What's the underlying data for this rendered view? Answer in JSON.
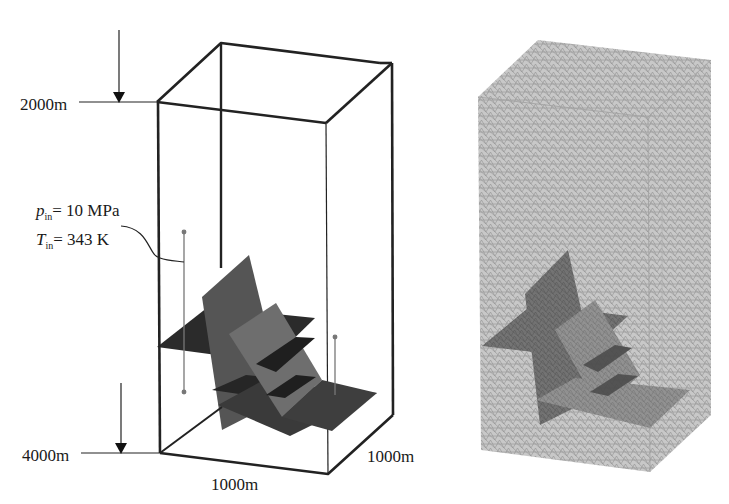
{
  "left_panel": {
    "name": "geometric-model",
    "depth_top_label": "2000m",
    "depth_bottom_label": "4000m",
    "width_label": "1000m",
    "length_label": "1000m",
    "injection": {
      "pressure_symbol": "p",
      "pressure_sub": "in",
      "pressure_value": "= 10 MPa",
      "temperature_symbol": "T",
      "temperature_sub": "in",
      "temperature_value": "= 343 K"
    }
  },
  "right_panel": {
    "name": "mesh-model"
  },
  "colors": {
    "frame": "#222222",
    "fracture_dark": "#2a2a2a",
    "fracture_mid": "#555555",
    "fracture_light": "#6e6e6e",
    "mesh_bg": "#b9b9b9",
    "mesh_line": "#8a8a8a"
  }
}
